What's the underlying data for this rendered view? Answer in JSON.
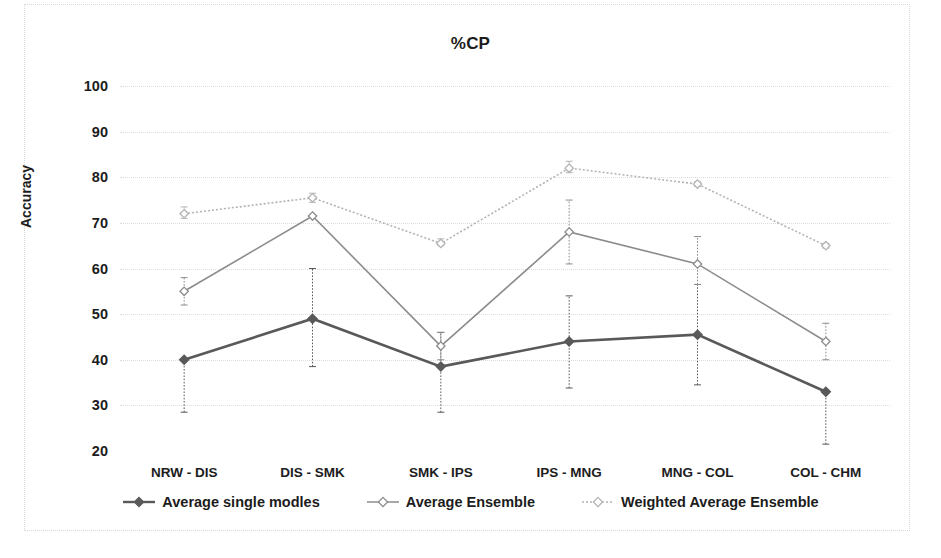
{
  "chart_data": {
    "type": "line",
    "title": "%CP",
    "xlabel": "",
    "ylabel": "Accuracy",
    "ylim": [
      20,
      100
    ],
    "yticks": [
      20,
      30,
      40,
      50,
      60,
      70,
      80,
      90,
      100
    ],
    "grid": true,
    "legend_position": "bottom",
    "categories": [
      "NRW - DIS",
      "DIS - SMK",
      "SMK - IPS",
      "IPS - MNG",
      "MNG - COL",
      "COL - CHM"
    ],
    "series": [
      {
        "name": "Average single modles",
        "color": "#595959",
        "marker": "diamond",
        "line_style": "solid",
        "values": [
          40.0,
          49.0,
          38.5,
          44.0,
          45.5,
          33.0
        ],
        "error_low": [
          28.5,
          38.5,
          28.5,
          33.8,
          34.5,
          21.5
        ],
        "error_high": [
          40.0,
          60.0,
          46.0,
          54.0,
          56.5,
          33.0
        ]
      },
      {
        "name": "Average Ensemble",
        "color": "#8c8c8c",
        "marker": "diamond-open",
        "line_style": "solid",
        "values": [
          55.0,
          71.5,
          43.0,
          68.0,
          61.0,
          44.0
        ],
        "error_low": [
          52.0,
          71.5,
          40.0,
          61.0,
          56.5,
          40.0
        ],
        "error_high": [
          58.0,
          71.5,
          46.0,
          75.0,
          67.0,
          48.0
        ]
      },
      {
        "name": "Weighted Average Ensemble",
        "color": "#b3b3b3",
        "marker": "diamond-open",
        "line_style": "dotted",
        "values": [
          72.0,
          75.5,
          65.5,
          82.0,
          78.5,
          65.0
        ],
        "error_low": [
          71.0,
          74.5,
          65.0,
          81.0,
          78.0,
          64.5
        ],
        "error_high": [
          73.5,
          76.5,
          66.5,
          83.5,
          79.0,
          65.5
        ]
      }
    ]
  },
  "legend": {
    "items": [
      {
        "label": "Average single modles"
      },
      {
        "label": "Average Ensemble"
      },
      {
        "label": "Weighted Average Ensemble"
      }
    ]
  }
}
